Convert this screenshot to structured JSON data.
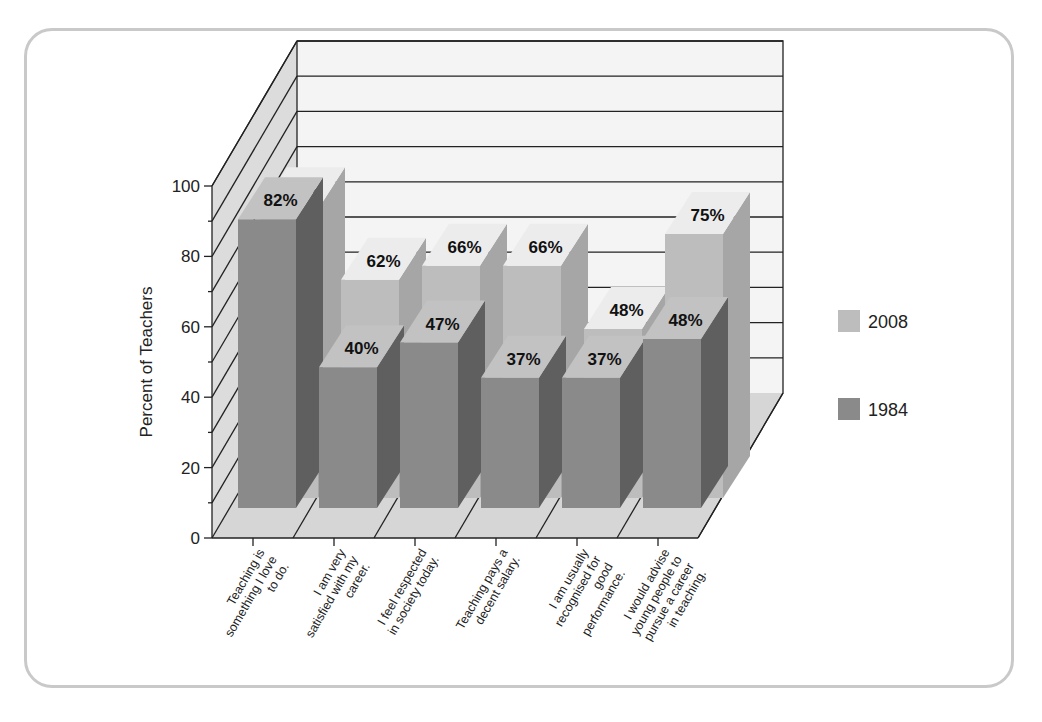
{
  "chart_data": {
    "type": "bar",
    "subtype": "3d-clustered-bar",
    "title": "",
    "xlabel": "",
    "ylabel": "Percent of Teachers",
    "ylim": [
      0,
      100
    ],
    "yticks": [
      0,
      20,
      40,
      60,
      80,
      100
    ],
    "grid": true,
    "legend_position": "right",
    "categories": [
      "Teaching is something I love to do.",
      "I am very satisfied with my career.",
      "I feel respected in society today.",
      "Teaching pays a decent salary.",
      "I am usually recognised for good performance.",
      "I would advise young people to pursue a career in teaching."
    ],
    "series": [
      {
        "name": "1984",
        "values": [
          82,
          40,
          47,
          37,
          37,
          48
        ],
        "color": "#8a8a8a"
      },
      {
        "name": "2008",
        "values": [
          82,
          62,
          66,
          66,
          48,
          75
        ],
        "color": "#bdbdbd"
      }
    ],
    "data_labels": {
      "1984": [
        "82%",
        "40%",
        "47%",
        "37%",
        "37%",
        "48%"
      ],
      "2008": [
        "82%",
        "62%",
        "66%",
        "66%",
        "48%",
        "75%"
      ]
    }
  },
  "legend": {
    "items": [
      {
        "label": "2008",
        "color": "#bdbdbd"
      },
      {
        "label": "1984",
        "color": "#8a8a8a"
      }
    ]
  },
  "axis": {
    "ylabel": "Percent of Teachers",
    "yticks": [
      "0",
      "20",
      "40",
      "60",
      "80",
      "100"
    ],
    "xlabels": [
      [
        "Teaching is",
        "something I love",
        "to do."
      ],
      [
        "I am very",
        "satisfied with my",
        "career."
      ],
      [
        "I feel respected",
        "in society today."
      ],
      [
        "Teaching pays a",
        "decent salary."
      ],
      [
        "I am usually",
        "recognised for",
        "good",
        "performance."
      ],
      [
        "I would advise",
        "young people to",
        "pursue a career",
        "in teaching."
      ]
    ]
  }
}
